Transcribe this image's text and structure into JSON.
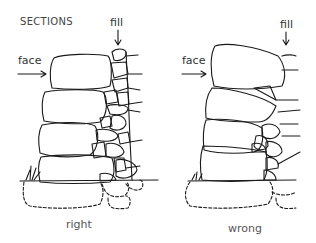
{
  "figure": {
    "title": "SECTIONS",
    "colors": {
      "ink": "#1a1a1a",
      "background": "#ffffff",
      "text": "#333333"
    },
    "panels": [
      {
        "caption": "right",
        "labels": {
          "face": "face",
          "fill": "fill"
        }
      },
      {
        "caption": "wrong",
        "labels": {
          "face": "face",
          "fill": "fill"
        }
      }
    ]
  }
}
